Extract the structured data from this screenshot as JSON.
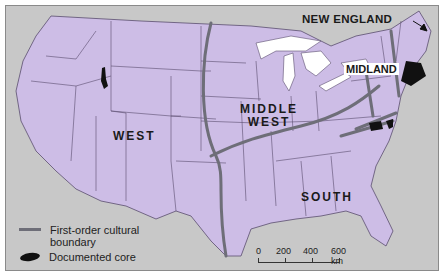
{
  "map": {
    "regions": [
      {
        "id": "west",
        "label": "WEST"
      },
      {
        "id": "middle-west",
        "label_line1": "MIDDLE",
        "label_line2": "WEST"
      },
      {
        "id": "south",
        "label": "SOUTH"
      },
      {
        "id": "midland",
        "label": "MIDLAND"
      },
      {
        "id": "new-england",
        "label": "NEW ENGLAND"
      }
    ],
    "colors": {
      "land": "#cdbde6",
      "water": "#c8c8c8",
      "lakes": "#ffffff",
      "state_border": "#5a4e6e",
      "cultural_boundary": "#6e6e78",
      "core": "#111111"
    }
  },
  "legend": {
    "boundary_label_line1": "First-order cultural",
    "boundary_label_line2": "boundary",
    "core_label": "Documented core"
  },
  "scale": {
    "ticks": [
      "0",
      "200",
      "400",
      "600 km"
    ]
  }
}
